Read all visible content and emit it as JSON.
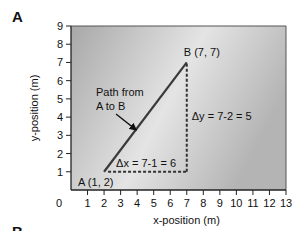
{
  "panel_label": "A",
  "next_panel_label": "B",
  "chart_data": {
    "type": "line",
    "title": "",
    "xlabel": "x-position (m)",
    "ylabel": "y-position (m)",
    "xlim": [
      0,
      13
    ],
    "ylim": [
      0,
      9
    ],
    "x_ticks": [
      1,
      2,
      3,
      4,
      5,
      6,
      7,
      8,
      9,
      10,
      11,
      12,
      13
    ],
    "y_ticks": [
      1,
      2,
      3,
      4,
      5,
      6,
      7,
      8,
      9
    ],
    "origin_label": "0",
    "grid": false,
    "background": "gray gradient",
    "series": [
      {
        "name": "Path from A to B",
        "x": [
          2,
          7
        ],
        "y": [
          1,
          7
        ],
        "style": "solid"
      }
    ],
    "points": [
      {
        "label": "A (1, 2)",
        "x": 2,
        "y": 1
      },
      {
        "label": "B (7, 7)",
        "x": 7,
        "y": 7
      }
    ],
    "annotations": [
      {
        "text_line1": "Path from",
        "text_line2": "A to B",
        "arrow_to": [
          4,
          3.3
        ]
      },
      {
        "text": "Δx = 7-1 = 6",
        "type": "dotted horizontal",
        "from": [
          2,
          1
        ],
        "to": [
          7,
          1
        ]
      },
      {
        "text": "Δy = 7-2 = 5",
        "type": "dotted vertical",
        "from": [
          7,
          1
        ],
        "to": [
          7,
          7
        ]
      }
    ]
  },
  "colors": {
    "plot_bg_dark": "#a9a9a9",
    "plot_bg_light": "#e6e6e6",
    "line": "#3a3a3a",
    "axis": "#222222"
  }
}
